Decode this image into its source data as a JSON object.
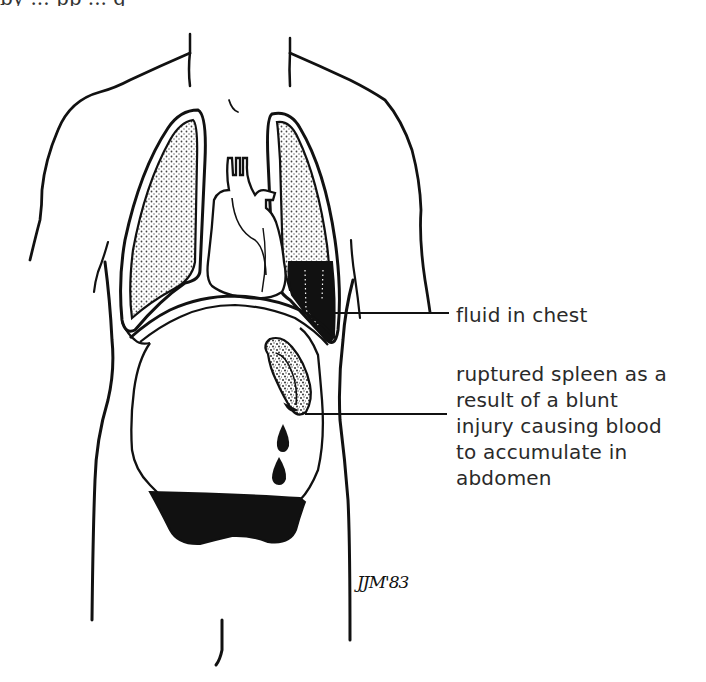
{
  "figure": {
    "type": "medical-illustration",
    "colors": {
      "ink": "#111111",
      "background": "#ffffff",
      "label_text": "#2a2a2a",
      "stipple": "#555555"
    }
  },
  "top_cutoff_text": "by ... pp ... g",
  "labels": {
    "fluid_in_chest": "fluid in chest",
    "ruptured_spleen": {
      "lines": [
        "ruptured spleen as a",
        "result of a blunt",
        "injury causing blood",
        "to accumulate in",
        "abdomen"
      ]
    }
  },
  "signature": "JJM'83"
}
